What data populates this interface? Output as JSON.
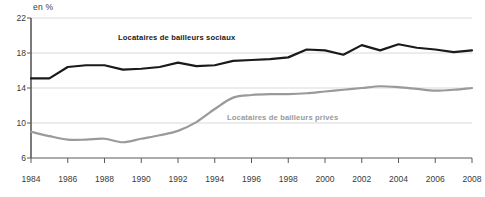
{
  "chart_data": {
    "type": "line",
    "title": "",
    "subtitle": "",
    "xlabel": "",
    "ylabel": "en %",
    "unit_label": "en %",
    "grid": true,
    "legend_position": "inline-labels",
    "xlim": [
      1984,
      2008
    ],
    "ylim": [
      6,
      22
    ],
    "y_ticks": [
      22,
      18,
      14,
      10,
      6
    ],
    "x_ticks": [
      1984,
      1986,
      1988,
      1990,
      1992,
      1994,
      1996,
      1998,
      2000,
      2002,
      2004,
      2006,
      2008
    ],
    "x": [
      1984,
      1985,
      1986,
      1987,
      1988,
      1989,
      1990,
      1991,
      1992,
      1993,
      1994,
      1995,
      1996,
      1997,
      1998,
      1999,
      2000,
      2001,
      2002,
      2003,
      2004,
      2005,
      2006,
      2007,
      2008
    ],
    "series": [
      {
        "name": "Locataires de bailleurs sociaux",
        "color": "#1a1a1a",
        "values": [
          15.1,
          15.1,
          16.4,
          16.6,
          16.6,
          16.1,
          16.2,
          16.4,
          16.9,
          16.5,
          16.6,
          17.1,
          17.2,
          17.3,
          17.5,
          18.4,
          18.3,
          17.8,
          18.9,
          18.3,
          19.0,
          18.6,
          18.4,
          18.1,
          18.3
        ]
      },
      {
        "name": "Locataires de bailleurs privés",
        "color": "#9a9a9a",
        "values": [
          9.0,
          8.5,
          8.1,
          8.1,
          8.2,
          7.8,
          8.2,
          8.6,
          9.1,
          10.1,
          11.6,
          12.9,
          13.2,
          13.3,
          13.3,
          13.4,
          13.6,
          13.8,
          14.0,
          14.2,
          14.1,
          13.9,
          13.7,
          13.8,
          14.0
        ]
      }
    ],
    "annotations": [
      {
        "text": "Locataires de bailleurs sociaux",
        "series": "social"
      },
      {
        "text": "Locataires de bailleurs privés",
        "series": "prive"
      }
    ],
    "colors": {
      "social_line": "#1a1a1a",
      "prive_line": "#9a9a9a",
      "gridline": "#d9d9d9",
      "axis": "#6b6b6b",
      "text": "#3a3a3a",
      "background": "#ffffff"
    }
  }
}
